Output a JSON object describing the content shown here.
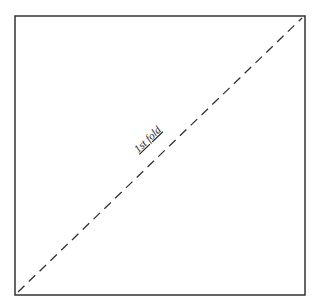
{
  "diagram": {
    "square": {
      "x": 15,
      "y": 16,
      "width": 290,
      "height": 279,
      "stroke": "#333333"
    },
    "fold_line": {
      "x1": 18,
      "y1": 292,
      "x2": 302,
      "y2": 18,
      "stroke": "#333333",
      "dash": "9 6"
    },
    "label": {
      "text": "1st fold",
      "x": 150,
      "y": 142,
      "rotate": -44
    }
  }
}
